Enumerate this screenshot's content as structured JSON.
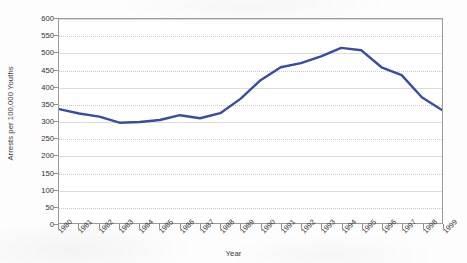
{
  "chart_data": {
    "type": "line",
    "title": "",
    "xlabel": "Year",
    "ylabel": "Arrests per 100,000 Youths",
    "categories": [
      "1980",
      "1981",
      "1982",
      "1983",
      "1984",
      "1985",
      "1986",
      "1987",
      "1988",
      "1989",
      "1990",
      "1991",
      "1992",
      "1993",
      "1994",
      "1995",
      "1996",
      "1997",
      "1998",
      "1999"
    ],
    "values": [
      335,
      322,
      313,
      295,
      297,
      303,
      317,
      308,
      323,
      365,
      420,
      458,
      470,
      490,
      515,
      508,
      458,
      435,
      370,
      332
    ],
    "series": [
      {
        "name": "Arrest rate",
        "color": "#3b4ca0",
        "values": [
          335,
          322,
          313,
          295,
          297,
          303,
          317,
          308,
          323,
          365,
          420,
          458,
          470,
          490,
          515,
          508,
          458,
          435,
          370,
          332
        ]
      }
    ],
    "ylim": [
      0,
      600
    ],
    "y_ticks": [
      0,
      50,
      100,
      150,
      200,
      250,
      300,
      350,
      400,
      450,
      500,
      550,
      600
    ],
    "y_tick_labels": [
      "0",
      "50",
      "100",
      "150",
      "200",
      "250",
      "300",
      "350",
      "400",
      "450",
      "500",
      "550",
      "600"
    ],
    "grid": true,
    "grid_axis": "y",
    "legend": "none",
    "line_color": "#3b4ca0",
    "plot_background": "#ffffff",
    "grid_color": "#c9c9c9",
    "axis_color": "#9a9a9a"
  }
}
